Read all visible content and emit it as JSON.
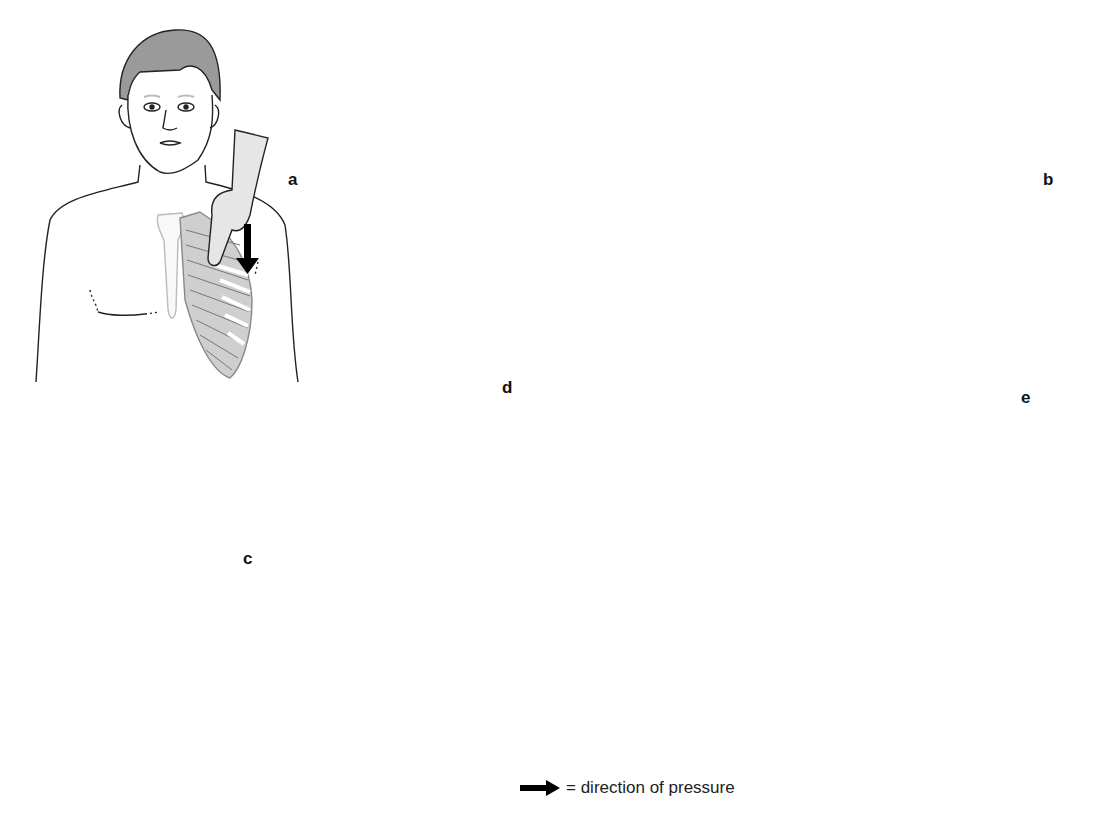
{
  "figure": {
    "panels": [
      {
        "id": "a",
        "label": "a",
        "description": "Frontal view of man, hand pressing down on lower left rib cage",
        "arrow_direction": "down"
      },
      {
        "id": "b",
        "label": "b",
        "description": "Supine side view with spine, hand under lumbar spine pushing upward",
        "arrow_direction": "up"
      },
      {
        "id": "c",
        "label": "c",
        "description": "Supine person, examiner hand on abdomen, arrow pointing up",
        "arrow_direction": "up"
      },
      {
        "id": "d",
        "label": "d",
        "description": "Face with finger pressing on upper lip",
        "arrow_direction": "none"
      },
      {
        "id": "e",
        "label": "e",
        "description": "Full frontal body with rib cage and pelvis, arrows pressing from right side on ribs and iliac crest",
        "arrow_direction": "left"
      }
    ],
    "legend": {
      "icon": "arrow-right-icon",
      "text": "= direction of pressure"
    },
    "colors": {
      "line": "#222222",
      "hair": "#9a9a9a",
      "skin_shade": "#e6e6e6",
      "bone_shade": "#c8c8c8",
      "arrow": "#000000"
    }
  }
}
